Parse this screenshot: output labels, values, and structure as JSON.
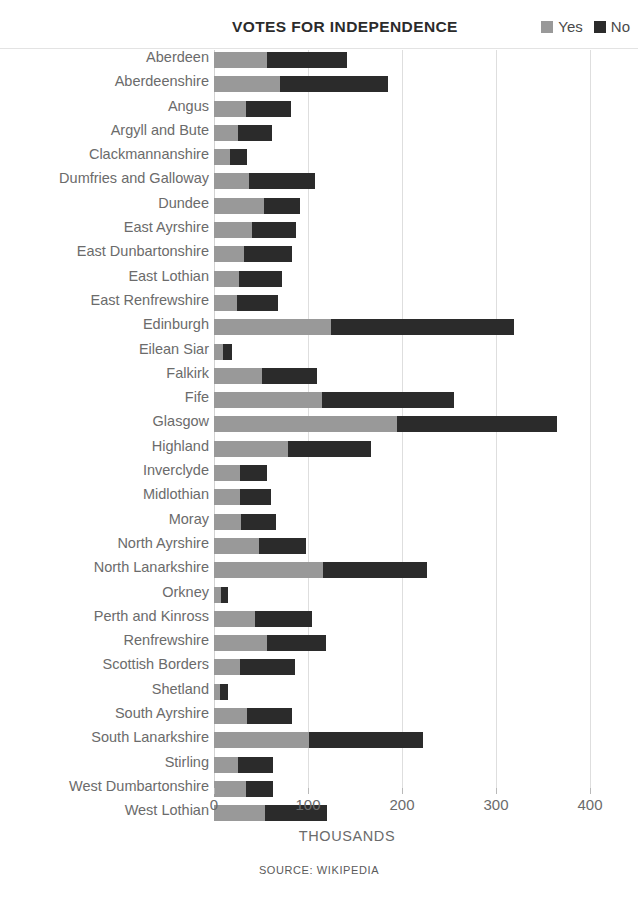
{
  "header": {
    "title": "VOTES FOR INDEPENDENCE",
    "legend": [
      {
        "label": "Yes",
        "color": "#999999",
        "name": "legend-item-yes"
      },
      {
        "label": "No",
        "color": "#2b2b2b",
        "name": "legend-item-no"
      }
    ]
  },
  "footer": {
    "source": "SOURCE: WIKIPEDIA"
  },
  "chart_data": {
    "type": "bar",
    "orientation": "horizontal",
    "stacked": true,
    "title": "VOTES FOR INDEPENDENCE",
    "xlabel": "THOUSANDS",
    "ylabel": "",
    "xlim": [
      0,
      420
    ],
    "xticks": [
      0,
      100,
      200,
      300,
      400
    ],
    "xtick_labels": [
      "0",
      "100",
      "200",
      "300",
      "400"
    ],
    "grid": true,
    "legend_position": "top-right",
    "units": "thousands of votes",
    "categories": [
      "Aberdeen",
      "Aberdeenshire",
      "Angus",
      "Argyll and Bute",
      "Clackmannanshire",
      "Dumfries and Galloway",
      "Dundee",
      "East Ayrshire",
      "East Dunbartonshire",
      "East Lothian",
      "East Renfrewshire",
      "Edinburgh",
      "Eilean Siar",
      "Falkirk",
      "Fife",
      "Glasgow",
      "Highland",
      "Inverclyde",
      "Midlothian",
      "Moray",
      "North Ayrshire",
      "North Lanarkshire",
      "Orkney",
      "Perth and Kinross",
      "Renfrewshire",
      "Scottish Borders",
      "Shetland",
      "South Ayrshire",
      "South Lanarkshire",
      "Stirling",
      "West Dumbartonshire",
      "West Lothian"
    ],
    "series": [
      {
        "name": "Yes",
        "color": "#999999",
        "values": [
          56,
          70,
          34,
          26,
          17,
          37,
          53,
          40,
          32,
          27,
          24,
          124,
          10,
          51,
          115,
          195,
          79,
          28,
          28,
          29,
          48,
          116,
          7,
          44,
          56,
          28,
          6,
          35,
          101,
          26,
          34,
          54
        ]
      },
      {
        "name": "No",
        "color": "#2b2b2b",
        "values": [
          85,
          115,
          48,
          36,
          18,
          70,
          39,
          47,
          51,
          45,
          44,
          195,
          9,
          59,
          140,
          170,
          88,
          28,
          33,
          37,
          50,
          111,
          8,
          60,
          63,
          58,
          9,
          48,
          121,
          37,
          29,
          66
        ]
      }
    ]
  }
}
